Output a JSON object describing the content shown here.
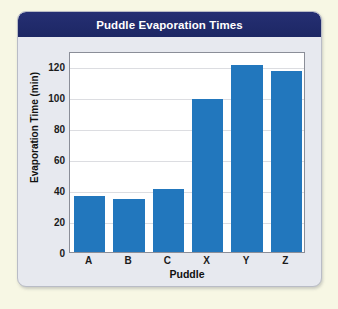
{
  "card": {
    "title": "Puddle Evaporation Times",
    "title_bar_color": "#232d70",
    "body_color": "#e7e9ef",
    "page_background": "#f7f7e4"
  },
  "chart_data": {
    "type": "bar",
    "title": "Puddle Evaporation Times",
    "xlabel": "Puddle",
    "ylabel": "Evaporation Time (min)",
    "categories": [
      "A",
      "B",
      "C",
      "X",
      "Y",
      "Z"
    ],
    "values": [
      36,
      34,
      41,
      99,
      121,
      117
    ],
    "ylim": [
      0,
      130
    ],
    "yticks": [
      0,
      20,
      40,
      60,
      80,
      100,
      120
    ],
    "ytick_labels": [
      "0",
      "20",
      "40",
      "60",
      "80",
      "100",
      "120"
    ],
    "grid": true,
    "grid_axis": "y",
    "legend": false,
    "bar_color": "#2277bd",
    "plot_background": "#ffffff"
  }
}
